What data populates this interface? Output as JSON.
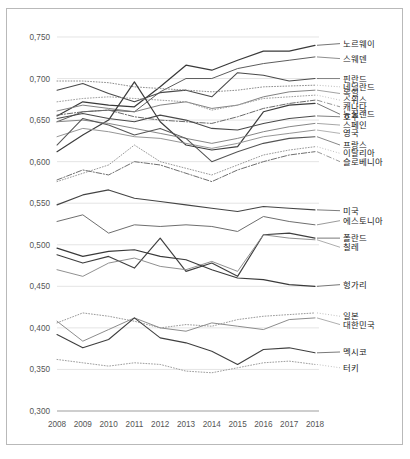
{
  "chart_data": {
    "type": "line",
    "title": "",
    "xlabel": "",
    "ylabel": "",
    "x": [
      2008,
      2009,
      2010,
      2011,
      2012,
      2013,
      2014,
      2015,
      2016,
      2017,
      2018
    ],
    "xtick_labels": [
      "2008",
      "2009",
      "2010",
      "2011",
      "2012",
      "2013",
      "2014",
      "2015",
      "2016",
      "2017",
      "2018"
    ],
    "ytick_labels": [
      "0,300",
      "0,350",
      "0,400",
      "0,450",
      "0,500",
      "0,550",
      "0,600",
      "0,650",
      "0,700",
      "0,750"
    ],
    "ytick_values": [
      0.3,
      0.35,
      0.4,
      0.45,
      0.5,
      0.55,
      0.6,
      0.65,
      0.7,
      0.75
    ],
    "ylim": [
      0.3,
      0.762
    ],
    "xlim": [
      2008,
      2018
    ],
    "grid": true,
    "legend_position": "right-inline-labels",
    "decimal_separator": ",",
    "series": [
      {
        "name": "노르웨이",
        "label": "노르웨이",
        "style": "solid",
        "color": "#3a3a3a",
        "width": 1.25,
        "values": [
          0.655,
          0.672,
          0.668,
          0.666,
          0.69,
          0.716,
          0.71,
          0.722,
          0.733,
          0.733,
          0.74
        ]
      },
      {
        "name": "스웨덴",
        "label": "스웨덴",
        "style": "solid",
        "color": "#5d5d5d",
        "width": 1.0,
        "values": [
          0.648,
          0.66,
          0.662,
          0.66,
          0.684,
          0.7,
          0.7,
          0.712,
          0.718,
          0.722,
          0.726
        ]
      },
      {
        "name": "핀란드",
        "label": "핀란드",
        "style": "solid",
        "color": "#4a4a4a",
        "width": 1.1,
        "values": [
          0.686,
          0.694,
          0.682,
          0.672,
          0.683,
          0.686,
          0.678,
          0.707,
          0.704,
          0.697,
          0.7
        ]
      },
      {
        "name": "네덜란드",
        "label": "네덜란드",
        "style": "dotted",
        "color": "#8f8f8f",
        "width": 1.0,
        "values": [
          0.697,
          0.697,
          0.695,
          0.69,
          0.688,
          0.686,
          0.684,
          0.686,
          0.69,
          0.691,
          0.692
        ]
      },
      {
        "name": "독일",
        "label": "독일",
        "style": "solid",
        "color": "#7a7a7a",
        "width": 0.95,
        "values": [
          0.661,
          0.668,
          0.664,
          0.66,
          0.668,
          0.672,
          0.664,
          0.668,
          0.678,
          0.684,
          0.686
        ]
      },
      {
        "name": "스위스",
        "label": "스위스",
        "style": "dotted",
        "color": "#a0a0a0",
        "width": 1.0,
        "values": [
          0.672,
          0.676,
          0.678,
          0.676,
          0.674,
          0.672,
          0.662,
          0.668,
          0.676,
          0.678,
          0.68
        ]
      },
      {
        "name": "캐나다",
        "label": "캐나다",
        "style": "dashdot",
        "color": "#6b6b6b",
        "width": 1.0,
        "values": [
          0.656,
          0.66,
          0.662,
          0.654,
          0.65,
          0.648,
          0.646,
          0.654,
          0.664,
          0.67,
          0.674
        ]
      },
      {
        "name": "뉴질랜드",
        "label": "뉴질랜드",
        "style": "solid",
        "color": "#3d3d3d",
        "width": 1.2,
        "values": [
          0.612,
          0.632,
          0.65,
          0.696,
          0.648,
          0.62,
          0.614,
          0.618,
          0.66,
          0.668,
          0.67
        ]
      },
      {
        "name": "호주",
        "label": "호주",
        "style": "solid",
        "color": "#4a4a4a",
        "width": 1.1,
        "values": [
          0.652,
          0.658,
          0.652,
          0.648,
          0.656,
          0.65,
          0.64,
          0.638,
          0.646,
          0.652,
          0.655
        ]
      },
      {
        "name": "스페인",
        "label": "스페인",
        "style": "solid",
        "color": "#7f7f7f",
        "width": 0.95,
        "values": [
          0.648,
          0.65,
          0.646,
          0.64,
          0.634,
          0.628,
          0.622,
          0.628,
          0.636,
          0.642,
          0.646
        ]
      },
      {
        "name": "영국",
        "label": "영국",
        "style": "solid",
        "color": "#909090",
        "width": 0.95,
        "values": [
          0.63,
          0.64,
          0.636,
          0.63,
          0.628,
          0.622,
          0.616,
          0.622,
          0.63,
          0.634,
          0.638
        ]
      },
      {
        "name": "프랑스",
        "label": "프랑스",
        "style": "solid",
        "color": "#555555",
        "width": 1.05,
        "values": [
          0.62,
          0.652,
          0.644,
          0.632,
          0.64,
          0.628,
          0.6,
          0.612,
          0.622,
          0.628,
          0.63
        ]
      },
      {
        "name": "이탈리아",
        "label": "이탈리아",
        "style": "dotted",
        "color": "#9a9a9a",
        "width": 1.0,
        "values": [
          0.576,
          0.586,
          0.596,
          0.62,
          0.6,
          0.592,
          0.584,
          0.596,
          0.608,
          0.614,
          0.618
        ]
      },
      {
        "name": "슬로베니아",
        "label": "슬로베니아",
        "style": "dashdot",
        "color": "#707070",
        "width": 1.0,
        "values": [
          0.578,
          0.59,
          0.584,
          0.6,
          0.596,
          0.586,
          0.576,
          0.59,
          0.6,
          0.608,
          0.612
        ]
      },
      {
        "name": "미국",
        "label": "미국",
        "style": "solid",
        "color": "#444444",
        "width": 1.1,
        "values": [
          0.548,
          0.56,
          0.566,
          0.556,
          0.552,
          0.548,
          0.544,
          0.54,
          0.546,
          0.544,
          0.542
        ]
      },
      {
        "name": "에스토니아",
        "label": "에스토니아",
        "style": "solid",
        "color": "#6e6e6e",
        "width": 1.0,
        "values": [
          0.528,
          0.536,
          0.514,
          0.524,
          0.522,
          0.524,
          0.522,
          0.516,
          0.534,
          0.528,
          0.524
        ]
      },
      {
        "name": "폴란드",
        "label": "폴란드",
        "style": "solid",
        "color": "#3f3f3f",
        "width": 1.15,
        "values": [
          0.488,
          0.478,
          0.486,
          0.472,
          0.508,
          0.468,
          0.478,
          0.462,
          0.512,
          0.514,
          0.508
        ]
      },
      {
        "name": "칠레",
        "label": "칠레",
        "style": "solid",
        "color": "#8a8a8a",
        "width": 0.95,
        "values": [
          0.47,
          0.462,
          0.478,
          0.484,
          0.474,
          0.47,
          0.48,
          0.468,
          0.512,
          0.508,
          0.506
        ]
      },
      {
        "name": "헝가리",
        "label": "헝가리",
        "style": "solid",
        "color": "#3a3a3a",
        "width": 1.15,
        "values": [
          0.496,
          0.486,
          0.492,
          0.494,
          0.486,
          0.482,
          0.47,
          0.46,
          0.458,
          0.452,
          0.45
        ]
      },
      {
        "name": "일본",
        "label": "일본",
        "style": "dotted",
        "color": "#9a9a9a",
        "width": 1.0,
        "values": [
          0.406,
          0.418,
          0.414,
          0.408,
          0.4,
          0.404,
          0.402,
          0.41,
          0.414,
          0.416,
          0.418
        ]
      },
      {
        "name": "대한민국",
        "label": "대한민국",
        "style": "solid",
        "color": "#8d8d8d",
        "width": 1.0,
        "values": [
          0.408,
          0.384,
          0.398,
          0.412,
          0.4,
          0.396,
          0.406,
          0.402,
          0.398,
          0.41,
          0.412
        ]
      },
      {
        "name": "멕시코",
        "label": "멕시코",
        "style": "solid",
        "color": "#3f3f3f",
        "width": 1.1,
        "values": [
          0.392,
          0.376,
          0.386,
          0.412,
          0.388,
          0.382,
          0.372,
          0.356,
          0.374,
          0.376,
          0.37
        ]
      },
      {
        "name": "터키",
        "label": "터키",
        "style": "dotted",
        "color": "#9e9e9e",
        "width": 1.0,
        "values": [
          0.362,
          0.358,
          0.354,
          0.358,
          0.356,
          0.348,
          0.346,
          0.352,
          0.358,
          0.36,
          0.356
        ]
      }
    ],
    "label_callouts": [
      {
        "series": "노르웨이",
        "y": 0.742
      },
      {
        "series": "스웨덴",
        "y": 0.724
      },
      {
        "series": "핀란드",
        "y": 0.7
      },
      {
        "series": "네덜란드",
        "y": 0.69
      },
      {
        "series": "독일",
        "y": 0.682
      },
      {
        "series": "스위스",
        "y": 0.674
      },
      {
        "series": "캐나다",
        "y": 0.666
      },
      {
        "series": "뉴질랜드",
        "y": 0.657
      },
      {
        "series": "호주",
        "y": 0.654
      },
      {
        "series": "스페인",
        "y": 0.644
      },
      {
        "series": "영국",
        "y": 0.634
      },
      {
        "series": "프랑스",
        "y": 0.62
      },
      {
        "series": "이탈리아",
        "y": 0.61
      },
      {
        "series": "슬로베니아",
        "y": 0.6
      },
      {
        "series": "미국",
        "y": 0.541
      },
      {
        "series": "에스토니아",
        "y": 0.529
      },
      {
        "series": "폴란드",
        "y": 0.508
      },
      {
        "series": "칠레",
        "y": 0.497
      },
      {
        "series": "헝가리",
        "y": 0.452
      },
      {
        "series": "일본",
        "y": 0.414
      },
      {
        "series": "대한민국",
        "y": 0.404
      },
      {
        "series": "멕시코",
        "y": 0.371
      },
      {
        "series": "터키",
        "y": 0.352
      }
    ]
  }
}
